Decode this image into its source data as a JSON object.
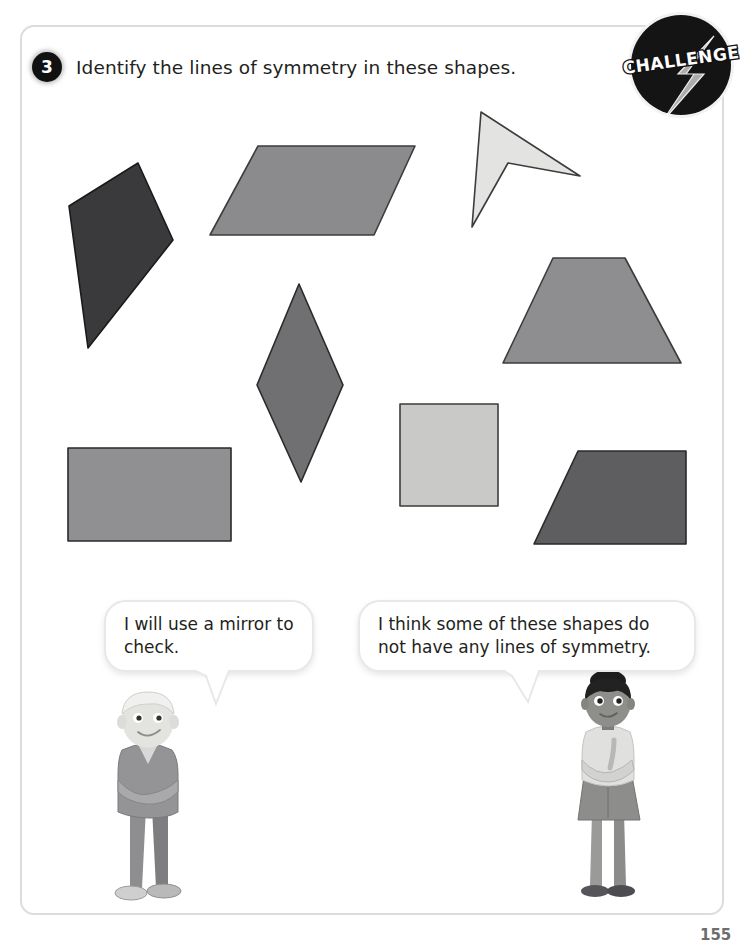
{
  "page": {
    "question_number": "3",
    "question_text": "Identify the lines of symmetry in these shapes.",
    "page_number": "155",
    "frame_border_color": "#dcdcdc",
    "background_color": "#ffffff"
  },
  "challenge_badge": {
    "label": "CHALLENGE",
    "icon": "lightning-bolt-icon",
    "circle_color": "#141414",
    "text_color": "#ffffff",
    "bolt_color": "#b3b3b3"
  },
  "shapes": [
    {
      "name": "dark-quadrilateral",
      "type": "irregular-quadrilateral",
      "fill": "#3a3a3c",
      "stroke": "#1a1a1a",
      "points": "138,163 173,240 88,348 69,206"
    },
    {
      "name": "parallelogram",
      "type": "parallelogram",
      "fill": "#8b8b8d",
      "stroke": "#3c3c3c",
      "points": "258,146 415,146 374,235 210,235"
    },
    {
      "name": "arrowhead-dart",
      "type": "concave-quadrilateral",
      "fill": "#e3e3e1",
      "stroke": "#3c3c3c",
      "points": "481,112 580,176 508,163 472,227"
    },
    {
      "name": "isosceles-trapezoid",
      "type": "trapezoid",
      "fill": "#8e8e90",
      "stroke": "#3c3c3c",
      "points": "553,258 625,258 681,363 503,363"
    },
    {
      "name": "rhombus",
      "type": "rhombus",
      "fill": "#707072",
      "stroke": "#2a2a2a",
      "points": "299,284 343,385 301,482 257,385"
    },
    {
      "name": "rectangle",
      "type": "rectangle",
      "fill": "#909092",
      "stroke": "#2a2a2a",
      "points": "68,448 231,448 231,541 68,541"
    },
    {
      "name": "square",
      "type": "square",
      "fill": "#c9c9c7",
      "stroke": "#3c3c3c",
      "points": "400,404 498,404 498,506 400,506"
    },
    {
      "name": "right-trapezoid",
      "type": "trapezoid",
      "fill": "#5e5e60",
      "stroke": "#2a2a2a",
      "points": "578,451 686,451 686,544 534,544"
    }
  ],
  "speech_bubbles": [
    {
      "name": "boy-bubble",
      "speaker": "boy",
      "text": "I will use a mirror to check."
    },
    {
      "name": "girl-bubble",
      "speaker": "girl",
      "text": "I think some of these shapes do not have any lines of symmetry."
    }
  ],
  "characters": [
    {
      "name": "boy-character",
      "description": "boy-avatar"
    },
    {
      "name": "girl-character",
      "description": "girl-avatar"
    }
  ]
}
